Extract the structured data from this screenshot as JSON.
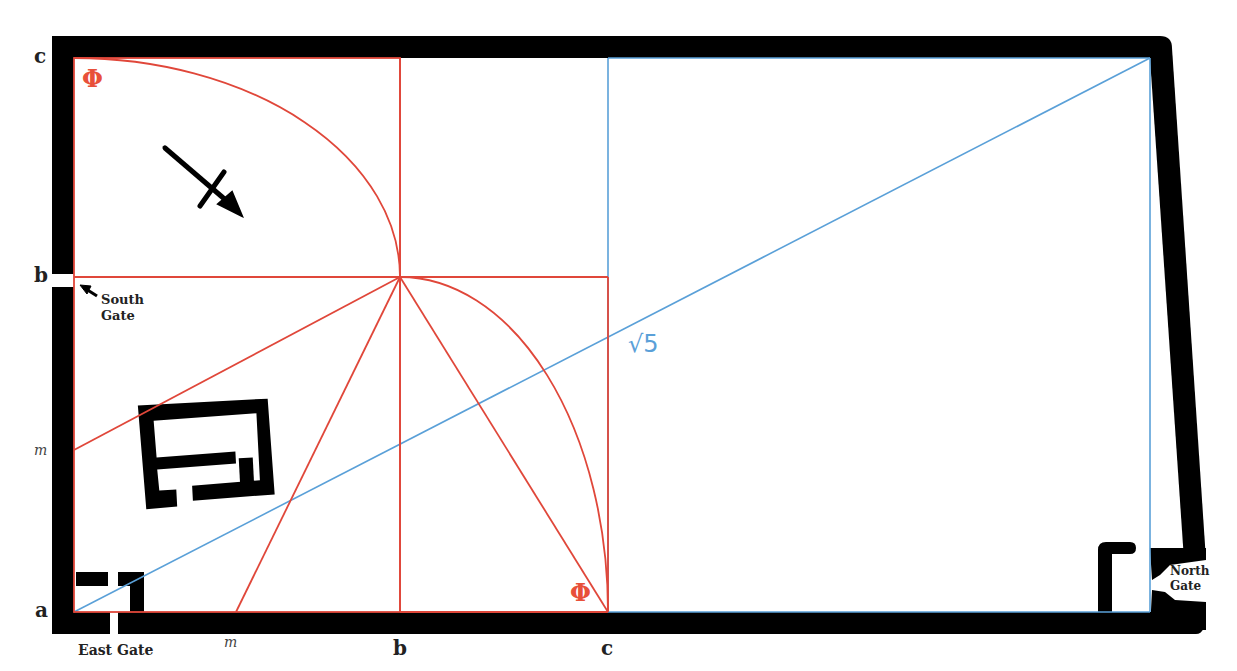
{
  "labels": {
    "left_c": "c",
    "left_b": "b",
    "left_m": "m",
    "left_a": "a",
    "bottom_m": "m",
    "bottom_b": "b",
    "bottom_c": "c",
    "south_gate": "South Gate",
    "south_gate_line1": "South",
    "south_gate_line2": "Gate",
    "east_gate": "East Gate",
    "north_gate_line1": "North",
    "north_gate_line2": "Gate",
    "phi_top": "Φ",
    "phi_bottom": "Φ",
    "sqrt5": "√5"
  },
  "colors": {
    "wall": "#000000",
    "golden_lines": "#e0473a",
    "diagonal_lines": "#5aa0d8",
    "background": "#ffffff"
  },
  "icons": {
    "north_arrow": "compass-arrow-icon",
    "gate_pointer": "arrow-pointer-icon"
  }
}
